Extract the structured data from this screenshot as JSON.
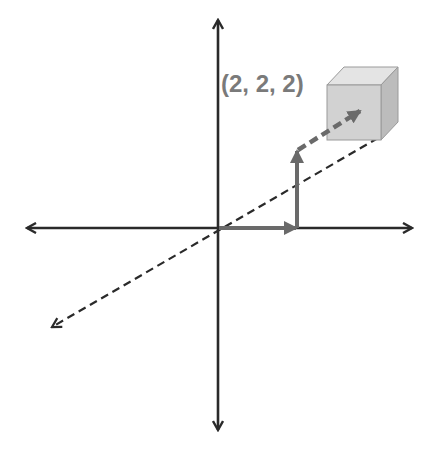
{
  "diagram": {
    "point_label": "(2, 2, 2)",
    "colors": {
      "axis": "#2a2a2a",
      "vector": "#6a6a6a",
      "label": "#7a7a7a",
      "cube_front": "#d2d2d2",
      "cube_top": "#e4e4e4",
      "cube_side": "#bcbcbc",
      "cube_edge": "#9a9a9a"
    },
    "axes": [
      {
        "name": "x-axis",
        "style": "solid",
        "direction": "horizontal"
      },
      {
        "name": "y-axis",
        "style": "solid",
        "direction": "vertical"
      },
      {
        "name": "z-axis",
        "style": "dashed",
        "direction": "diagonal"
      }
    ],
    "vectors": [
      {
        "name": "x-component",
        "style": "solid",
        "value": 2
      },
      {
        "name": "y-component",
        "style": "solid",
        "value": 2
      },
      {
        "name": "z-component",
        "style": "dashed",
        "value": 2
      }
    ],
    "point": {
      "x": 2,
      "y": 2,
      "z": 2,
      "marker": "cube"
    }
  }
}
